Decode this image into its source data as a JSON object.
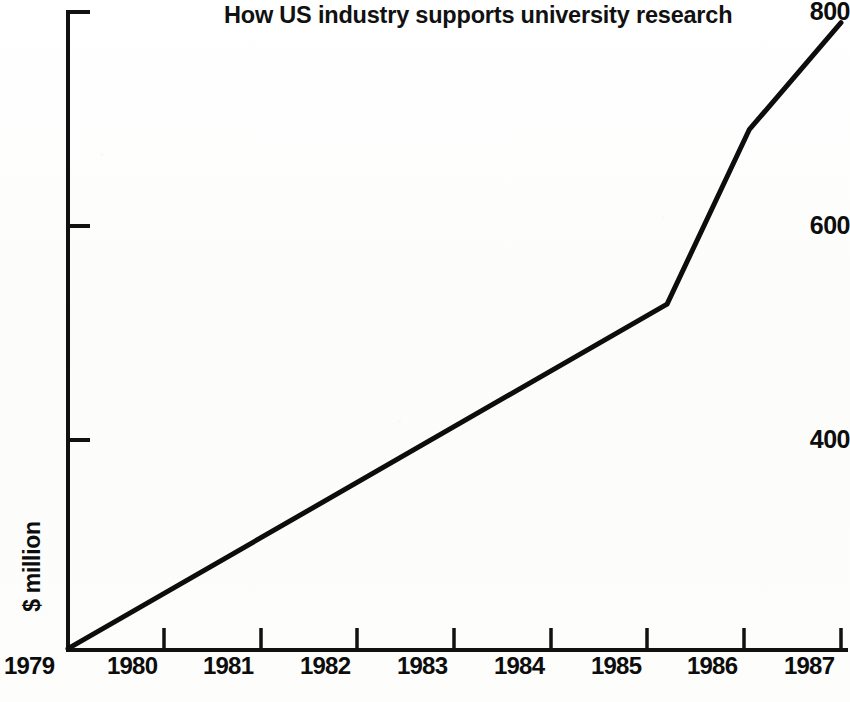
{
  "chart_data": {
    "type": "line",
    "title": "How US industry supports university research",
    "xlabel": "",
    "ylabel": "$ million",
    "xlim": [
      1979,
      1987
    ],
    "ylim": [
      205,
      800
    ],
    "grid": false,
    "legend": "none",
    "x_ticks": [
      "1979",
      "1980",
      "1981",
      "1982",
      "1983",
      "1984",
      "1985",
      "1986",
      "1987"
    ],
    "y_ticks": [
      "400",
      "600",
      "800"
    ],
    "series": [
      {
        "name": "Industry support for university research",
        "x": [
          1979,
          1985.2,
          1986.05,
          1987
        ],
        "values": [
          205,
          527,
          690,
          790
        ]
      }
    ],
    "line_color": "#0d0d0d",
    "background_color": "#fdfdfd"
  },
  "axes": {
    "y_axis_name": "y-axis",
    "x_axis_name": "x-axis",
    "y_label_text": "$ million"
  }
}
